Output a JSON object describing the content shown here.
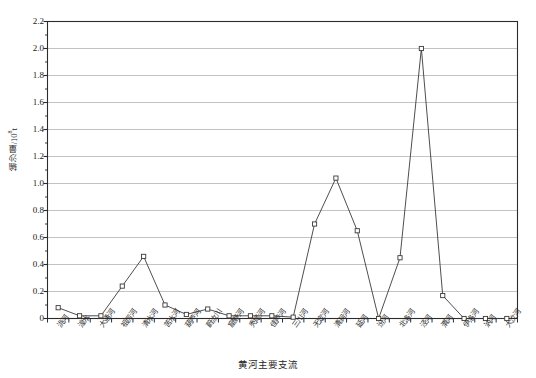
{
  "chart_data": {
    "type": "line",
    "title": "",
    "xlabel": "黄河主要支流",
    "ylabel": "输沙量/10⁸t",
    "ylabel_main": "输沙量/10",
    "ylabel_exp": "8",
    "ylabel_unit": "t",
    "ylim": [
      0,
      2.2
    ],
    "ytick_step": 0.2,
    "yminor_step": 0.1,
    "grid": true,
    "grid_axis": "y",
    "legend": "none",
    "marker": "open-square",
    "line_color": "#3a3a3a",
    "grid_color": "#b4b4b4",
    "categories": [
      "洮河",
      "湟水",
      "大通河",
      "祖厉河",
      "清水河",
      "苦水河",
      "葫芦河",
      "蔚汝川",
      "窟野河",
      "秃尾河",
      "佳芦河",
      "三川河",
      "无定河",
      "清涧河",
      "延河",
      "汾河",
      "北洛河",
      "泾河",
      "渭河",
      "伊洛河",
      "汭河",
      "大汶河"
    ],
    "values": [
      0.08,
      0.02,
      0.02,
      0.24,
      0.46,
      0.1,
      0.03,
      0.07,
      0.02,
      0.02,
      0.02,
      0.01,
      0.7,
      1.04,
      0.65,
      0.0,
      0.45,
      2.0,
      0.17,
      0.0,
      0.0,
      0.0
    ],
    "ytick_labels": [
      "0",
      "0.2",
      "0.4",
      "0.6",
      "0.8",
      "1.0",
      "1.2",
      "1.4",
      "1.6",
      "1.8",
      "2.0",
      "2.2"
    ],
    "ytick_values": [
      0,
      0.2,
      0.4,
      0.6,
      0.8,
      1.0,
      1.2,
      1.4,
      1.6,
      1.8,
      2.0,
      2.2
    ]
  }
}
